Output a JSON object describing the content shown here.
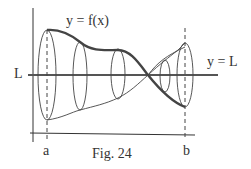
{
  "figure": {
    "caption": "Fig. 24",
    "function_label": "y = f(x)",
    "line_label": "y = L",
    "axis_line_label": "L",
    "x_start_label": "a",
    "x_end_label": "b"
  },
  "colors": {
    "stroke": "#333333",
    "thick_curve": "#444444",
    "background": "#ffffff"
  }
}
